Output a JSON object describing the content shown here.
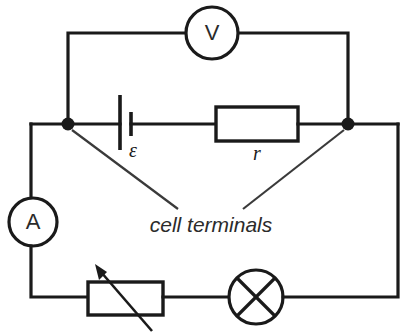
{
  "diagram": {
    "background_color": "#ffffff",
    "line_color": "#1a1a1a",
    "components": {
      "voltmeter": {
        "label": "V",
        "name": "voltmeter",
        "cx": 212,
        "cy": 33,
        "r": 26
      },
      "ammeter": {
        "label": "A",
        "name": "ammeter",
        "cx": 33,
        "cy": 222,
        "r": 24
      },
      "cell": {
        "label": "ε",
        "name": "cell-emf"
      },
      "internal_resistor": {
        "label": "r",
        "name": "internal-resistance"
      },
      "rheostat": {
        "label": "",
        "name": "variable-resistor"
      },
      "lamp": {
        "label": "",
        "name": "lamp",
        "cx": 256,
        "cy": 297,
        "r": 27
      }
    },
    "annotations": {
      "cell_terminals": "cell terminals"
    },
    "nodes": {
      "left_terminal_label": "left cell terminal",
      "right_terminal_label": "right cell terminal"
    }
  }
}
